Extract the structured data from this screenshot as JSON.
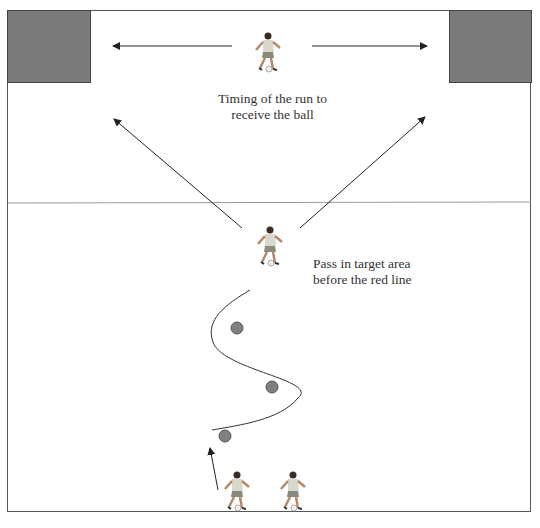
{
  "diagram": {
    "type": "football training drill",
    "labels": {
      "timing_line1": "Timing of the run to",
      "timing_line2": "receive the ball",
      "pass_line1": "Pass in target area",
      "pass_line2": "before the red line"
    },
    "colors": {
      "goal_fill": "#7a7a7a",
      "cone_fill": "#808080",
      "line": "#333333",
      "field_border": "#555555",
      "divider_line": "#999999"
    },
    "elements": {
      "goals": [
        "left target box",
        "right target box"
      ],
      "players": 4,
      "cones": 3
    }
  }
}
